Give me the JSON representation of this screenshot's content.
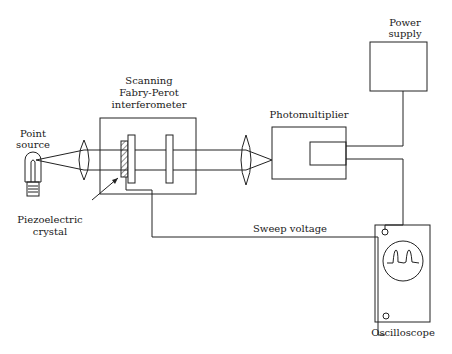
{
  "diagram": {
    "components": {
      "point_source": {
        "label_line1": "Point",
        "label_line2": "source"
      },
      "interferometer": {
        "label_line1": "Scanning",
        "label_line2": "Fabry-Perot",
        "label_line3": "interferometer"
      },
      "piezo": {
        "label_line1": "Piezoelectric",
        "label_line2": "crystal"
      },
      "photomultiplier": {
        "label": "Photomultiplier"
      },
      "power_supply": {
        "label_line1": "Power",
        "label_line2": "supply"
      },
      "oscilloscope": {
        "label": "Oscilloscope"
      },
      "sweep": {
        "label": "Sweep voltage"
      }
    },
    "colors": {
      "line": "#222222",
      "background": "#ffffff"
    }
  }
}
